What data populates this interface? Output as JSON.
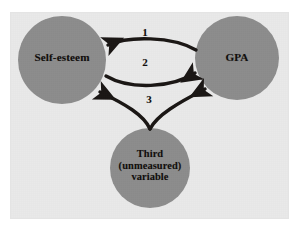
{
  "figure": {
    "background_color": "#ffffff",
    "panel_color": "#e9e9e9",
    "node_fill_color": "#8c8c8c",
    "arrow_color": "#1a1614",
    "text_color": "#100d0b"
  },
  "nodes": [
    {
      "id": "self-esteem",
      "label": "Self-esteem"
    },
    {
      "id": "gpa",
      "label": "GPA"
    },
    {
      "id": "third-variable",
      "label": "Third (unmeasured) variable",
      "lines": [
        "Third",
        "(unmeasured)",
        "variable"
      ]
    }
  ],
  "edges": [
    {
      "id": "edge-1",
      "label": "1",
      "from": "gpa",
      "to": "self-esteem",
      "description": "GPA causes Self-esteem"
    },
    {
      "id": "edge-2",
      "label": "2",
      "from": "self-esteem",
      "to": "gpa",
      "description": "Self-esteem causes GPA"
    },
    {
      "id": "edge-3",
      "label": "3",
      "from": "third-variable",
      "to": "self-esteem and gpa",
      "description": "Third unmeasured variable causes both"
    }
  ]
}
